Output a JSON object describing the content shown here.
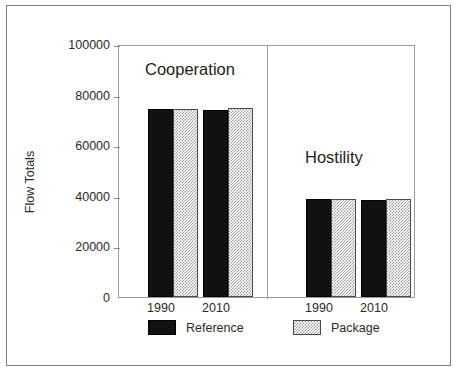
{
  "chart_data": {
    "type": "bar",
    "title": "",
    "xlabel": "",
    "ylabel": "Flow Totals",
    "ylim": [
      0,
      100000
    ],
    "yticks": [
      0,
      20000,
      40000,
      60000,
      80000,
      100000
    ],
    "ytick_labels": [
      "0",
      "20000",
      "40000",
      "60000",
      "80000",
      "100000"
    ],
    "grid": false,
    "legend_position": "bottom",
    "panels": [
      {
        "label": "Cooperation",
        "categories": [
          "1990",
          "2010"
        ],
        "series": [
          {
            "name": "Reference",
            "values": [
              75000,
              74700
            ]
          },
          {
            "name": "Package",
            "values": [
              75000,
              75500
            ]
          }
        ]
      },
      {
        "label": "Hostility",
        "categories": [
          "1990",
          "2010"
        ],
        "series": [
          {
            "name": "Reference",
            "values": [
              39000,
              38800
            ]
          },
          {
            "name": "Package",
            "values": [
              39000,
              39000
            ]
          }
        ]
      }
    ],
    "series_names": [
      "Reference",
      "Package"
    ],
    "colors": {
      "reference": "#111111",
      "package": "#9c9c9c",
      "axis": "#9a9a9a",
      "text": "#2b2b2b",
      "frame": "#7d7d7d",
      "background": "#ffffff"
    }
  },
  "axis": {
    "title": "Flow Totals",
    "ticks": [
      {
        "label": "100000",
        "value": 100000
      },
      {
        "label": "80000",
        "value": 80000
      },
      {
        "label": "60000",
        "value": 60000
      },
      {
        "label": "40000",
        "value": 40000
      },
      {
        "label": "20000",
        "value": 20000
      },
      {
        "label": "0",
        "value": 0
      }
    ]
  },
  "panel_labels": {
    "left": "Cooperation",
    "right": "Hostility"
  },
  "xtick_labels": {
    "coop_1990": "1990",
    "coop_2010": "2010",
    "host_1990": "1990",
    "host_2010": "2010"
  },
  "legend": {
    "reference_label": "Reference",
    "package_label": "Package"
  }
}
